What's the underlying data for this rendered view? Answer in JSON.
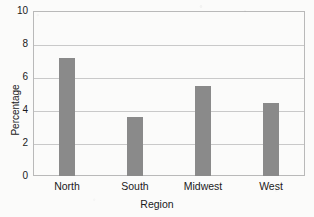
{
  "chart_data": {
    "type": "bar",
    "title": "",
    "categories": [
      "North",
      "South",
      "Midwest",
      "West"
    ],
    "values": [
      7.15,
      3.6,
      5.45,
      4.45
    ],
    "xlabel": "Region",
    "ylabel": "Percentage",
    "ylim": [
      0,
      10
    ],
    "yticks": [
      0,
      2,
      4,
      6,
      8,
      10
    ],
    "ytick_labels": [
      "0",
      "2",
      "4",
      "6",
      "8",
      "10"
    ],
    "grid": true,
    "legend": "none",
    "bar_color": "#8a8a8a",
    "gridline_color": "#c9c9c9",
    "frame_color": "#b9b9b9",
    "background_color": "#fbfbfa"
  }
}
